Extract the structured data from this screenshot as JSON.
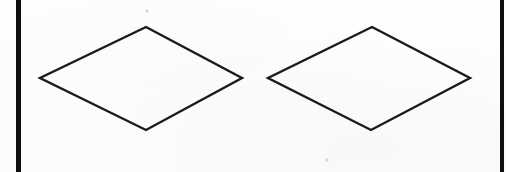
{
  "figure": {
    "canvas": {
      "width": 506,
      "height": 172,
      "background_color": "#fdfdfc"
    },
    "ink_color": "#1b1a1a",
    "rule_color": "#100f0f",
    "stroke_width": 2.4,
    "rules": [
      {
        "name": "left-vertical-rule",
        "x": 16,
        "y": 0,
        "width": 5,
        "height": 172
      },
      {
        "name": "right-vertical-rule",
        "x": 500,
        "y": 0,
        "width": 4,
        "height": 172
      }
    ],
    "shapes": [
      {
        "name": "left-rhombus",
        "label": "Rhombus 1",
        "points": "146,27 242,78 146,130 40,78",
        "vertices": {
          "top": [
            146,
            27
          ],
          "right": [
            242,
            78
          ],
          "bottom": [
            146,
            130
          ],
          "left": [
            40,
            78
          ]
        },
        "width": 202,
        "height": 103
      },
      {
        "name": "right-rhombus",
        "label": "Rhombus 2",
        "points": "372,27 470,78 371,130 268,78",
        "vertices": {
          "top": [
            372,
            27
          ],
          "right": [
            470,
            78
          ],
          "bottom": [
            371,
            130
          ],
          "left": [
            268,
            78
          ]
        },
        "width": 202,
        "height": 103
      }
    ],
    "specks": [
      {
        "name": "scan-speck-top",
        "cx": 147,
        "cy": 11,
        "r": 1.6
      },
      {
        "name": "scan-speck-bottom",
        "cx": 327,
        "cy": 160,
        "r": 1.4
      }
    ]
  }
}
